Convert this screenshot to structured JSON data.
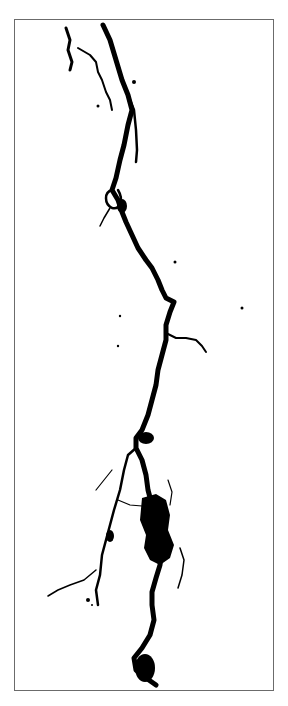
{
  "figure": {
    "colors": {
      "ink": "#000000",
      "background": "#ffffff",
      "frame": "#6b6b6b"
    }
  }
}
